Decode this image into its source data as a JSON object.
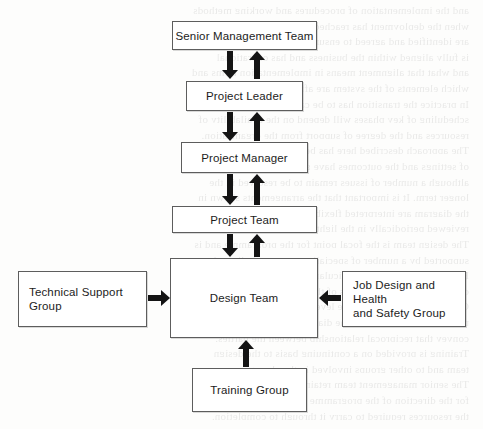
{
  "diagram": {
    "type": "organisation-flow-chart",
    "nodes": [
      {
        "id": "senior-management-team",
        "label": "Senior Management Team",
        "x": 172,
        "y": 21,
        "w": 145,
        "h": 29,
        "align": "center"
      },
      {
        "id": "project-leader",
        "label": "Project Leader",
        "x": 186,
        "y": 81,
        "w": 117,
        "h": 30,
        "align": "center"
      },
      {
        "id": "project-manager",
        "label": "Project Manager",
        "x": 181,
        "y": 142,
        "w": 127,
        "h": 31,
        "align": "center"
      },
      {
        "id": "project-team",
        "label": "Project Team",
        "x": 172,
        "y": 206,
        "w": 145,
        "h": 27,
        "align": "center"
      },
      {
        "id": "design-team",
        "label": "Design Team",
        "x": 170,
        "y": 258,
        "w": 148,
        "h": 80,
        "align": "center"
      },
      {
        "id": "technical-support-group",
        "label": "Technical  Support\nGroup",
        "x": 18,
        "y": 271,
        "w": 129,
        "h": 56,
        "align": "left"
      },
      {
        "id": "job-design-and-health-and-safety-group",
        "label": "Job Design and Health\nand Safety Group",
        "x": 342,
        "y": 271,
        "w": 124,
        "h": 56,
        "align": "left"
      },
      {
        "id": "training-group",
        "label": "Training Group",
        "x": 192,
        "y": 368,
        "w": 115,
        "h": 44,
        "align": "center"
      }
    ],
    "arrows": [
      {
        "id": "smt-to-leader",
        "direction": "down",
        "x": 222,
        "y": 51,
        "length": 28
      },
      {
        "id": "leader-to-smt",
        "direction": "up",
        "x": 249,
        "y": 51,
        "length": 28
      },
      {
        "id": "leader-to-manager",
        "direction": "down",
        "x": 222,
        "y": 112,
        "length": 29
      },
      {
        "id": "manager-to-leader",
        "direction": "up",
        "x": 249,
        "y": 112,
        "length": 29
      },
      {
        "id": "manager-to-team",
        "direction": "down",
        "x": 222,
        "y": 174,
        "length": 31
      },
      {
        "id": "team-to-manager",
        "direction": "up",
        "x": 249,
        "y": 174,
        "length": 31
      },
      {
        "id": "team-to-design",
        "direction": "down",
        "x": 222,
        "y": 234,
        "length": 23
      },
      {
        "id": "design-to-team",
        "direction": "up",
        "x": 249,
        "y": 234,
        "length": 23
      },
      {
        "id": "technical-to-design",
        "direction": "right",
        "x": 148,
        "y": 290,
        "length": 22
      },
      {
        "id": "job-design-to-design",
        "direction": "left",
        "x": 319,
        "y": 290,
        "length": 22
      },
      {
        "id": "training-to-design",
        "direction": "up",
        "x": 238,
        "y": 340,
        "length": 27
      }
    ],
    "background_show_through": [
      "and the implementation of procedures and working methods",
      "when the deployment has reached a state where action plans",
      "are identified and agreed to ensure that the proposed review",
      "is fully aligned within the business and has operational",
      "and what that alignment means in implementation terms and",
      "which elements of the system are affected by that process.",
      "In practice the transition has to be carefully planned and the",
      "scheduling of key phases will depend on the availability of",
      "resources and the degree of support from the organisation.",
      "The approach described here has been applied in a number",
      "of settings and the outcomes have generally been positive,",
      "although a number of issues remain to be resolved in the",
      "longer term. It is important that the arrangements shown in",
      "the diagram are interpreted flexibly and that the roles are",
      "reviewed periodically in the light of changing circumstances.",
      "The design team is the focal point for the programme and is",
      "supported by a number of specialist groups as indicated.",
      "Each group contributes particular expertise and is able to",
      "draw on the wider resources of the organisation as required.",
      "Communication between the levels shown is a two-way",
      "process and the arrows in the diagram are intended to",
      "convey that reciprocal relationship between the parties.",
      "Training is provided on a continuing basis to the design",
      "team and to other groups involved in the change process.",
      "The senior management team retains overall responsibility",
      "for the direction of the programme and for the allocation of",
      "the resources required to carry it through to completion."
    ]
  }
}
